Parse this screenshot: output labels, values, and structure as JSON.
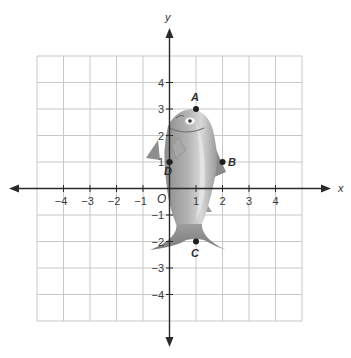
{
  "diagram": {
    "type": "coordinate-plane",
    "axis_labels": {
      "x": "x",
      "y": "y"
    },
    "origin_label": "O",
    "x_tick_labels": [
      "−4",
      "−3",
      "−2",
      "−1",
      "1",
      "2",
      "3",
      "4"
    ],
    "y_tick_labels": [
      "4",
      "3",
      "2",
      "1",
      "−1",
      "−2",
      "−3",
      "−4"
    ],
    "grid_range": {
      "x": [
        -5,
        5
      ],
      "y": [
        -5,
        5
      ]
    },
    "points": [
      {
        "name": "A",
        "x": 1,
        "y": 3
      },
      {
        "name": "B",
        "x": 2,
        "y": 1
      },
      {
        "name": "C",
        "x": 1,
        "y": -2
      },
      {
        "name": "D",
        "x": 0,
        "y": 1
      }
    ],
    "figure": "fish-image",
    "colors": {
      "grid": "#c8c8c8",
      "axis": "#2a2a2a",
      "fish_body": "#9a9a9a",
      "fish_light": "#d2d2d2",
      "point": "#1e1e1e"
    }
  }
}
